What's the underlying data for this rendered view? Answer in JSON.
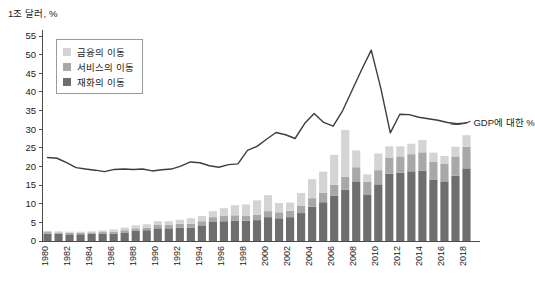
{
  "chart_data": {
    "type": "bar",
    "title": "1조 달러, %",
    "xlabel": "",
    "ylabel": "",
    "ylim": [
      0,
      55
    ],
    "ytick_step": 5,
    "yticks": [
      0,
      5,
      10,
      15,
      20,
      25,
      30,
      35,
      40,
      45,
      50,
      55
    ],
    "grid": false,
    "legend_position": "top-left",
    "x": [
      1980,
      1981,
      1982,
      1983,
      1984,
      1985,
      1986,
      1987,
      1988,
      1989,
      1990,
      1991,
      1992,
      1993,
      1994,
      1995,
      1996,
      1997,
      1998,
      1999,
      2000,
      2001,
      2002,
      2003,
      2004,
      2005,
      2006,
      2007,
      2008,
      2009,
      2010,
      2011,
      2012,
      2013,
      2014,
      2015,
      2016,
      2017,
      2018
    ],
    "xtick_labels": [
      "1980",
      "1982",
      "1984",
      "1986",
      "1988",
      "1990",
      "1992",
      "1994",
      "1996",
      "1998",
      "2000",
      "2002",
      "2004",
      "2006",
      "2008",
      "2010",
      "2012",
      "2014",
      "2016",
      "2018"
    ],
    "stacked": true,
    "series": [
      {
        "name": "재화의 이동",
        "color": "#6e6e6e",
        "values": [
          2.0,
          1.9,
          1.8,
          1.8,
          1.9,
          1.9,
          2.0,
          2.3,
          2.7,
          2.9,
          3.4,
          3.4,
          3.6,
          3.6,
          4.2,
          5.1,
          5.3,
          5.5,
          5.4,
          5.6,
          6.4,
          6.1,
          6.4,
          7.5,
          9.2,
          10.4,
          12.1,
          13.8,
          16.0,
          12.5,
          15.2,
          18.1,
          18.3,
          18.7,
          18.9,
          16.5,
          16.0,
          17.5,
          19.5
        ]
      },
      {
        "name": "서비스의 이동",
        "color": "#a8a8a8",
        "values": [
          0.4,
          0.4,
          0.4,
          0.4,
          0.4,
          0.5,
          0.5,
          0.6,
          0.7,
          0.7,
          0.9,
          0.9,
          1.0,
          1.0,
          1.1,
          1.3,
          1.4,
          1.4,
          1.4,
          1.5,
          1.6,
          1.6,
          1.7,
          1.9,
          2.3,
          2.6,
          3.0,
          3.4,
          3.8,
          3.4,
          3.8,
          4.3,
          4.4,
          4.6,
          4.9,
          4.8,
          4.8,
          5.2,
          5.8
        ]
      },
      {
        "name": "금융의 이동",
        "color": "#d4d4d4",
        "values": [
          0.3,
          0.3,
          0.3,
          0.3,
          0.3,
          0.4,
          0.6,
          0.7,
          0.8,
          0.9,
          1.0,
          1.0,
          1.1,
          1.5,
          1.4,
          1.6,
          2.1,
          2.7,
          3.0,
          3.8,
          4.3,
          2.5,
          2.2,
          3.5,
          5.1,
          5.6,
          8.0,
          12.6,
          4.5,
          2.0,
          4.5,
          3.0,
          2.7,
          2.8,
          3.3,
          2.4,
          2.0,
          2.6,
          3.1
        ]
      }
    ],
    "line_series": {
      "name": "GDP에 대한 %",
      "color": "#3d3d3d",
      "annotation": "GDP에 대한 %",
      "values": [
        22.4,
        22.2,
        21.0,
        19.7,
        19.3,
        19.0,
        18.6,
        19.2,
        19.3,
        19.2,
        19.3,
        18.8,
        19.1,
        19.3,
        20.1,
        21.2,
        21.0,
        20.2,
        19.8,
        20.5,
        20.7,
        24.3,
        25.4,
        27.3,
        29.1,
        28.5,
        27.5,
        31.5,
        34.2,
        31.8,
        30.8,
        35.0,
        40.5,
        46.0,
        51.2,
        41.0,
        29.0,
        34.0,
        33.9,
        33.2,
        32.8,
        32.4,
        31.8,
        31.5,
        31.7
      ]
    }
  },
  "legend": {
    "items": [
      {
        "label": "금융의 이동",
        "color": "#d4d4d4"
      },
      {
        "label": "서비스의 이동",
        "color": "#a8a8a8"
      },
      {
        "label": "재화의 이동",
        "color": "#6e6e6e"
      }
    ]
  }
}
